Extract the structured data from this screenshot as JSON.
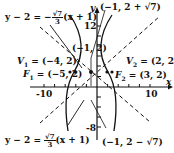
{
  "diagram": {
    "type": "hyperbola",
    "center": [
      -1,
      2
    ],
    "axes": {
      "x_label": "x",
      "y_label": "y"
    },
    "ticks": {
      "x_left": "-10",
      "x_right": "10",
      "y_top": "12",
      "y_bottom": "-8"
    },
    "asymptote_top": {
      "lhs": "y − 2 = −",
      "frac_num": "√7",
      "frac_den": "3",
      "rhs": "(x + 1)"
    },
    "asymptote_bottom": {
      "lhs": "y − 2 = ",
      "frac_num": "√7",
      "frac_den": "3",
      "rhs": "(x + 1)"
    },
    "points": {
      "top": "(−1, 2 + √7)",
      "center": "(−1, 2)",
      "bottom": "(−1, 2 − √7)",
      "V1": {
        "name": "V",
        "sub": "1",
        "value": " = (−4, 2)"
      },
      "V2": {
        "name": "V",
        "sub": "2",
        "value": " = (2, 2)"
      },
      "F1": {
        "name": "F",
        "sub": "1",
        "value": " = (−5, 2)"
      },
      "F2": {
        "name": "F",
        "sub": "2",
        "value": " = (3, 2)"
      }
    }
  }
}
